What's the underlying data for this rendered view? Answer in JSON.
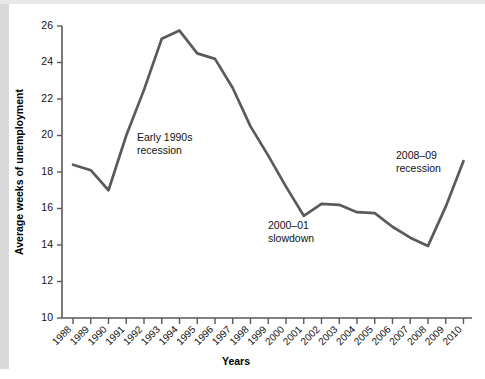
{
  "chart_data": {
    "type": "line",
    "title": "",
    "xlabel": "Years",
    "ylabel": "Average weeks of unemployment",
    "ylim": [
      10,
      26
    ],
    "ytick_values": [
      10,
      12,
      14,
      16,
      18,
      20,
      22,
      24,
      26
    ],
    "ytick_labels": [
      "10",
      "12",
      "14",
      "16",
      "18",
      "20",
      "22",
      "24",
      "26"
    ],
    "grid": false,
    "legend": "none",
    "categories": [
      "1988",
      "1989",
      "1990",
      "1991",
      "1992",
      "1993",
      "1994",
      "1995",
      "1996",
      "1997",
      "1998",
      "1999",
      "2000",
      "2001",
      "2002",
      "2003",
      "2004",
      "2005",
      "2006",
      "2007",
      "2008",
      "2009",
      "2010"
    ],
    "values": [
      18.4,
      18.1,
      17.0,
      20.0,
      22.5,
      25.3,
      25.75,
      24.5,
      24.2,
      22.6,
      20.5,
      18.9,
      17.2,
      15.6,
      16.25,
      16.2,
      15.8,
      15.75,
      15.0,
      14.4,
      13.95,
      16.1,
      18.6
    ],
    "series_color": "#5a5a5a",
    "annotations": [
      {
        "name": "early-1990s-recession",
        "line1": "Early 1990s",
        "line2": "recession",
        "x": 137,
        "y": 141
      },
      {
        "name": "2000-01-slowdown",
        "line1": "2000–01",
        "line2": "slowdown",
        "x": 268,
        "y": 229
      },
      {
        "name": "2008-09-recession",
        "line1": "2008–09",
        "line2": "recession",
        "x": 396,
        "y": 159
      }
    ]
  }
}
